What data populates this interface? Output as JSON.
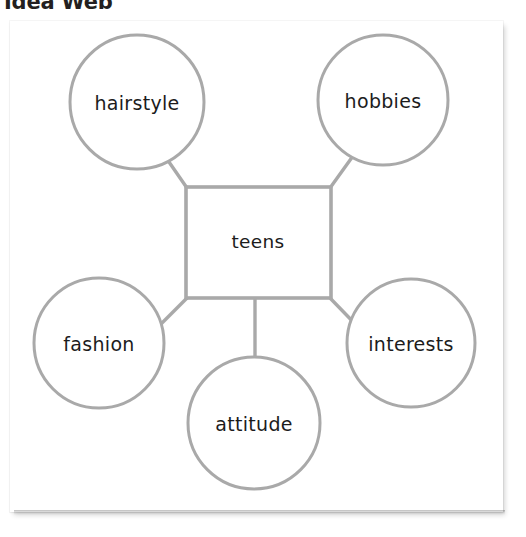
{
  "page": {
    "title": "Idea Web",
    "background_color": "#ffffff"
  },
  "card": {
    "background_color": "#ffffff",
    "shadow_color": "#b5b5b5"
  },
  "diagram": {
    "type": "idea-web",
    "stroke_color": "#a7a7a7",
    "text_color": "#1c1c1c",
    "center": {
      "label": "teens",
      "shape": "square"
    },
    "nodes": [
      {
        "id": "hairstyle",
        "label": "hairstyle",
        "shape": "circle",
        "position": "top-left"
      },
      {
        "id": "hobbies",
        "label": "hobbies",
        "shape": "circle",
        "position": "top-right"
      },
      {
        "id": "fashion",
        "label": "fashion",
        "shape": "circle",
        "position": "left"
      },
      {
        "id": "interests",
        "label": "interests",
        "shape": "circle",
        "position": "right"
      },
      {
        "id": "attitude",
        "label": "attitude",
        "shape": "circle",
        "position": "bottom"
      }
    ],
    "connectors": [
      {
        "from": "teens",
        "to": "hairstyle"
      },
      {
        "from": "teens",
        "to": "hobbies"
      },
      {
        "from": "teens",
        "to": "fashion"
      },
      {
        "from": "teens",
        "to": "interests"
      },
      {
        "from": "teens",
        "to": "attitude"
      }
    ]
  }
}
